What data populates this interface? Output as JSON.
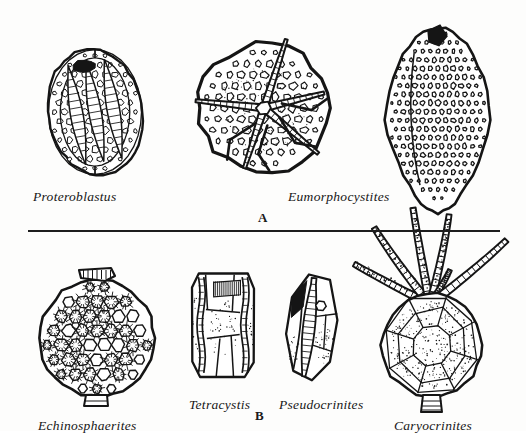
{
  "figure": {
    "background_color": "#fdfdfc",
    "ink_color": "#151515",
    "width": 526,
    "height": 431
  },
  "divider": {
    "name": "panel-divider-rule",
    "x": 28,
    "y": 230,
    "width": 472,
    "color": "#1d1d1d"
  },
  "panels": [
    {
      "letter": "A",
      "letter_x": 258,
      "letter_y": 211,
      "region": "top"
    },
    {
      "letter": "B",
      "letter_x": 255,
      "letter_y": 409,
      "region": "bottom"
    }
  ],
  "specimens": [
    {
      "id": "proteroblastus",
      "label": "Proteroblastus",
      "label_x": 33,
      "label_y": 190,
      "panel": "A",
      "cx": 95,
      "cy": 112,
      "rx": 47,
      "ry": 63,
      "form": "oval-blastoid",
      "rotation": -10,
      "plate_rows": 13,
      "plate_cols": 9,
      "has_ambulacra": true,
      "ambulacra_count": 3
    },
    {
      "id": "eumorphocystites-oral",
      "label": "Eumorphocystites",
      "label_x": 288,
      "label_y": 190,
      "panel": "A",
      "cx": 264,
      "cy": 108,
      "rx": 66,
      "ry": 64,
      "form": "oral-disc-with-arms",
      "rotation": 0,
      "plate_rows": 11,
      "plate_cols": 11,
      "has_ambulacra": true,
      "ambulacra_count": 5
    },
    {
      "id": "eumorphocystites-lateral",
      "label": "",
      "label_x": 0,
      "label_y": 0,
      "panel": "A",
      "cx": 438,
      "cy": 120,
      "rx": 53,
      "ry": 93,
      "form": "tall-ovoid",
      "rotation": 0,
      "plate_rows": 20,
      "plate_cols": 13,
      "has_ambulacra": false,
      "ambulacra_count": 0
    },
    {
      "id": "echinosphaerites",
      "label": "Echinosphaerites",
      "label_x": 38,
      "label_y": 419,
      "panel": "B",
      "cx": 97,
      "cy": 338,
      "rx": 57,
      "ry": 58,
      "form": "spherical-stellate",
      "rotation": 0,
      "plate_rows": 8,
      "plate_cols": 8,
      "has_ambulacra": false,
      "ambulacra_count": 0
    },
    {
      "id": "tetracystis",
      "label": "Tetracystis",
      "label_x": 189,
      "label_y": 398,
      "panel": "B",
      "cx": 223,
      "cy": 325,
      "rx": 31,
      "ry": 52,
      "form": "ribbed-box",
      "rotation": 0,
      "plate_rows": 5,
      "plate_cols": 3,
      "has_ambulacra": true,
      "ambulacra_count": 2
    },
    {
      "id": "pseudocrinites",
      "label": "Pseudocrinites",
      "label_x": 279,
      "label_y": 398,
      "panel": "B",
      "cx": 312,
      "cy": 327,
      "rx": 25,
      "ry": 53,
      "form": "lens-ridge",
      "rotation": 6,
      "plate_rows": 5,
      "plate_cols": 3,
      "has_ambulacra": true,
      "ambulacra_count": 1
    },
    {
      "id": "caryocrinites",
      "label": "Caryocrinites",
      "label_x": 394,
      "label_y": 419,
      "panel": "B",
      "cx": 432,
      "cy": 345,
      "rx": 50,
      "ry": 52,
      "form": "globular-with-arms",
      "rotation": 0,
      "plate_rows": 4,
      "plate_cols": 6,
      "has_ambulacra": false,
      "ambulacra_count": 0,
      "arm_count": 6
    }
  ]
}
